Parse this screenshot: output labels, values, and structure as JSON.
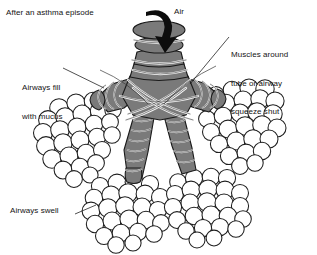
{
  "diagram": {
    "title": "After an asthma episode",
    "background_color": "#ffffff",
    "ink_color": "#141414",
    "cartilage_fill": "#7a7a7a",
    "cartilage_stroke": "#1a1a1a",
    "muscle_band_color": "#f2f2f2",
    "alveoli_fill": "#ffffff",
    "alveoli_stroke": "#1f1f1f",
    "arrow_color": "#0d0d0d"
  },
  "labels": {
    "title": "After an asthma episode",
    "air": "Air",
    "muscles_line1": "Muscles around",
    "muscles_line2": "tube or airway",
    "muscles_line3": "squeeze shut",
    "mucus_line1": "Airways fill",
    "mucus_line2": "with mucus",
    "swell": "Airways swell"
  },
  "parts": {
    "trachea": "trachea with cartilage rings",
    "bronchi": "branching bronchi",
    "alveoli": "alveolar sacs clusters",
    "smooth_muscle": "constricting smooth muscle bands",
    "airflow_arrow": "downward air intake arrow"
  }
}
